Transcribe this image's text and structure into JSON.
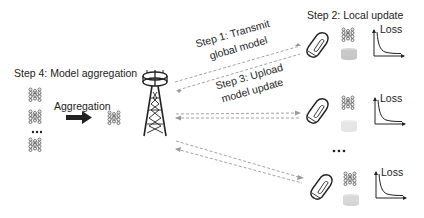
{
  "diagram": {
    "type": "federated-learning-workflow",
    "steps": {
      "step1": {
        "line1": "Step 1: Transmit",
        "line2": "global model"
      },
      "step2": "Step 2: Local update",
      "step3": {
        "line1": "Step 3: Upload",
        "line2": "model update"
      },
      "step4": "Step 4: Model aggregation"
    },
    "aggregation_label": "Aggregation",
    "server": {
      "icon": "cell-tower-icon"
    },
    "clients": [
      {
        "device": "phone-icon",
        "model": "neural-network-icon",
        "data": "dataset-icon",
        "chart_label": "Loss"
      },
      {
        "device": "phone-icon",
        "model": "neural-network-icon",
        "data": "dataset-icon",
        "chart_label": "Loss"
      },
      {
        "device": "phone-icon",
        "model": "neural-network-icon",
        "data": "dataset-icon",
        "chart_label": "Loss"
      }
    ],
    "ellipsis": "•••",
    "colors": {
      "arrow_dashed": "#9a9a9a",
      "ink": "#222222",
      "dataset": "#c9c9c9"
    }
  }
}
